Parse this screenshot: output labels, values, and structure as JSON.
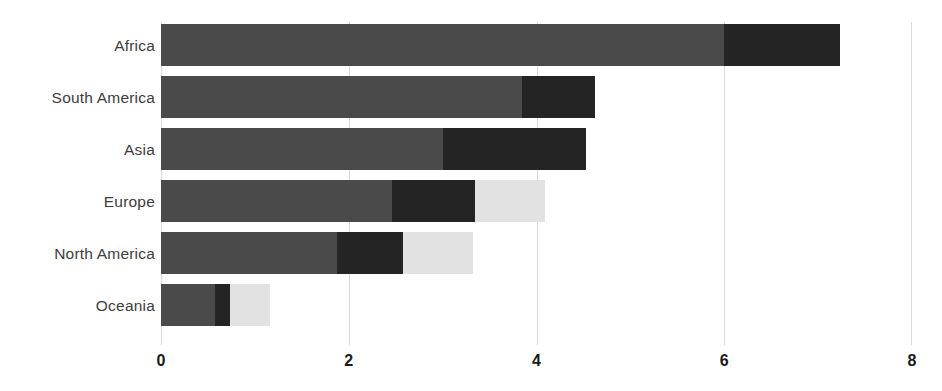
{
  "chart": {
    "title": "",
    "subtitle": "",
    "xlabel": "",
    "ylabel": ""
  },
  "chart_data": {
    "type": "bar",
    "orientation": "horizontal",
    "stacked": true,
    "title": "",
    "xlabel": "",
    "ylabel": "",
    "xlim": [
      0,
      8
    ],
    "ylim": null,
    "grid": "vertical",
    "legend": "none",
    "xticks": [
      "0",
      "2",
      "4",
      "6",
      "8"
    ],
    "xtick_values": [
      0,
      2,
      4,
      6,
      8
    ],
    "categories": [
      "Africa",
      "South America",
      "Asia",
      "Europe",
      "North America",
      "Oceania"
    ],
    "series": [
      {
        "name": "segment-1",
        "color": "#4a4a4a",
        "values": [
          6.0,
          3.85,
          3.0,
          2.46,
          1.88,
          0.58
        ]
      },
      {
        "name": "segment-2",
        "color": "#242424",
        "values": [
          1.23,
          0.77,
          1.53,
          0.89,
          0.7,
          0.15
        ]
      },
      {
        "name": "segment-3",
        "color": "#e2e2e2",
        "values": [
          0,
          0,
          0,
          0.74,
          0.74,
          0.43
        ]
      }
    ],
    "totals": [
      7.23,
      4.62,
      4.53,
      4.09,
      3.32,
      1.16
    ],
    "colors": {
      "segment_1": "#4a4a4a",
      "segment_2": "#242424",
      "segment_3": "#e2e2e2",
      "gridline": "#d9d9d9",
      "label_text": "#3d3d3d",
      "tick_text": "#1a1a1a",
      "background": "#ffffff"
    }
  }
}
